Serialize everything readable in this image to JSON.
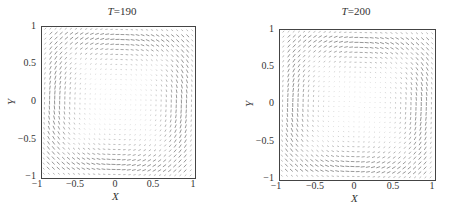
{
  "chart_data": [
    {
      "type": "quiver",
      "title": "T=190",
      "title_var": "T",
      "title_value": "190",
      "xlabel": "X",
      "ylabel": "Y",
      "xlim": [
        -1,
        1
      ],
      "ylim": [
        -1,
        1
      ],
      "xticks": [
        "-1",
        "-0.5",
        "0",
        "0.5",
        "1"
      ],
      "yticks": [
        "1",
        "0.5",
        "0",
        "-0.5",
        "-1"
      ],
      "description": "Velocity vector field showing a single clockwise-tilted circulating vortex in a square cavity, strongest flow along the walls, weak flow in an elongated core along the diagonal"
    },
    {
      "type": "quiver",
      "title": "T=200",
      "title_var": "T",
      "title_value": "200",
      "xlabel": "X",
      "ylabel": "Y",
      "xlim": [
        -1,
        1
      ],
      "ylim": [
        -1,
        1
      ],
      "xticks": [
        "-1",
        "-0.5",
        "0",
        "0.5",
        "1"
      ],
      "yticks": [
        "1",
        "0.5",
        "0",
        "-0.5",
        "-1"
      ],
      "description": "Velocity vector field showing a single circulating vortex in a square cavity, strongest flow along the walls, weak flow in an elongated core along the diagonal"
    }
  ],
  "panels": [
    {
      "title_var": "T",
      "title_rest": "=190",
      "xlabel": "X",
      "ylabel": "Y",
      "xticks": [
        "−1",
        "−0.5",
        "0",
        "0.5",
        "1"
      ],
      "yticks": [
        "1",
        "0.5",
        "0",
        "−0.5",
        "−1"
      ]
    },
    {
      "title_var": "T",
      "title_rest": "=200",
      "xlabel": "X",
      "ylabel": "Y",
      "xticks": [
        "−1",
        "−0.5",
        "0",
        "0.5",
        "1"
      ],
      "yticks": [
        "1",
        "0.5",
        "0",
        "−0.5",
        "−1"
      ]
    }
  ]
}
